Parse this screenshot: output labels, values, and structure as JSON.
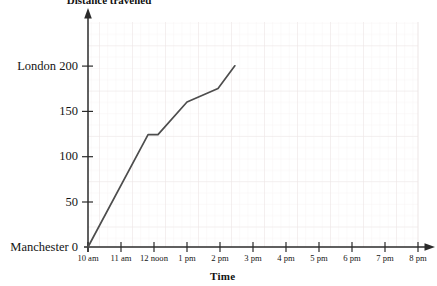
{
  "chart_data": {
    "type": "line",
    "title": "Distance travelled",
    "xlabel": "Time",
    "ylabel": "",
    "grid": true,
    "legend": "none",
    "x_ticks": [
      "10 am",
      "11 am",
      "12 noon",
      "1 pm",
      "2 pm",
      "3 pm",
      "4 pm",
      "5 pm",
      "6 pm",
      "7 pm",
      "8 pm"
    ],
    "x_tick_hours": [
      10,
      11,
      12,
      13,
      14,
      15,
      16,
      17,
      18,
      19,
      20
    ],
    "xlim": [
      10,
      20
    ],
    "y_ticks": [
      "Manchester 0",
      "50",
      "100",
      "150",
      "London 200"
    ],
    "y_tick_values": [
      0,
      50,
      100,
      150,
      200
    ],
    "ylim": [
      0,
      230
    ],
    "series": [
      {
        "name": "journey",
        "color": "#4d4d4d",
        "points": [
          {
            "x": 10.0,
            "y": 0
          },
          {
            "x": 11.82,
            "y": 124
          },
          {
            "x": 12.12,
            "y": 124
          },
          {
            "x": 13.0,
            "y": 160
          },
          {
            "x": 13.94,
            "y": 175
          },
          {
            "x": 14.45,
            "y": 200
          }
        ]
      }
    ]
  },
  "axis": {
    "y_arrow": "up-arrow-icon",
    "x_arrow": "right-arrow-icon"
  }
}
